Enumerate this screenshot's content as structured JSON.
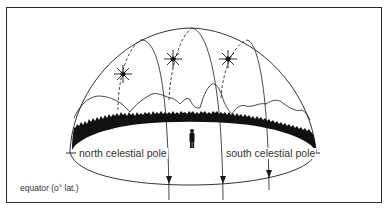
{
  "figure": {
    "type": "celestial-sphere-diagram",
    "labels": {
      "north_pole": "north celestial pole",
      "south_pole": "south celestial pole",
      "caption": "equator (o° lat.)"
    },
    "elements": {
      "stars": 3,
      "star_paths": 3,
      "observer": "person-silhouette",
      "horizon": "tree-line and mountains"
    },
    "colors": {
      "ink": "#1a1a1a",
      "frame": "#2a2a2a",
      "background": "#ffffff",
      "text": "#333333"
    }
  }
}
